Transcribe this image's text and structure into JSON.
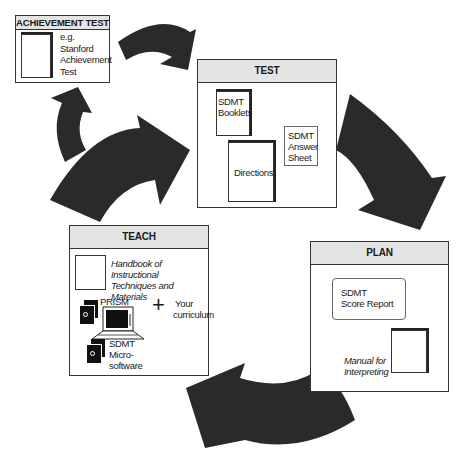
{
  "diagram": {
    "type": "cycle",
    "arrow_color": "#2a2a2a",
    "header_fill": "#e4e4e4",
    "flow": [
      "TEST",
      "PLAN",
      "TEACH",
      "TEST"
    ],
    "side_flow": [
      "TEACH",
      "ACHIEVEMENT TEST",
      "TEST"
    ]
  },
  "achievement": {
    "title": "ACHIEVEMENT TEST",
    "lines": [
      "e.g.",
      "Stanford",
      "Achievement",
      "Test"
    ]
  },
  "test": {
    "title": "TEST",
    "booklets": [
      "SDMT",
      "Booklets"
    ],
    "answer_sheet": [
      "SDMT",
      "Answer",
      "Sheet"
    ],
    "directions": "Directions"
  },
  "plan": {
    "title": "PLAN",
    "score_report": [
      "SDMT",
      "Score Report"
    ],
    "manual": [
      "Manual for",
      "Interpreting"
    ]
  },
  "teach": {
    "title": "TEACH",
    "handbook": [
      "Handbook of Instructional",
      "Techniques and Materials"
    ],
    "prism": "PRISM",
    "plus": "+",
    "curriculum": [
      "Your",
      "curriculum"
    ],
    "microsoftware": [
      "SDMT",
      "Micro-",
      "software"
    ]
  }
}
